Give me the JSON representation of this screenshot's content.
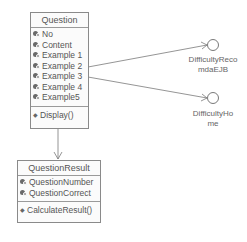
{
  "classes": [
    {
      "name": "Question",
      "attributes": [
        "No",
        "Content",
        "Example 1",
        "Example 2",
        "Example 3",
        "Example 4",
        "Example5"
      ],
      "operations": [
        "Display()"
      ]
    },
    {
      "name": "QuestionResult",
      "attributes": [
        "QuestionNumber",
        "QuestionCorrect"
      ],
      "operations": [
        "CalculateResult()"
      ]
    }
  ],
  "interfaces": [
    {
      "label_line1": "DifficultyReco",
      "label_line2": "mdaEJB"
    },
    {
      "label_line1": "DifficultyHo",
      "label_line2": "me"
    }
  ],
  "relations": [
    {
      "from": "Question",
      "to": "DifficultyRecomdaEJB",
      "type": "dependency"
    },
    {
      "from": "Question",
      "to": "DifficultyHome",
      "type": "dependency"
    },
    {
      "from": "Question",
      "to": "QuestionResult",
      "type": "dependency"
    }
  ],
  "colors": {
    "line": "#7a7a7a",
    "text": "#555555",
    "border": "#8a8a8a"
  }
}
